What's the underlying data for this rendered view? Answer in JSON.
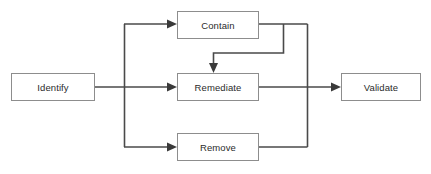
{
  "diagram": {
    "background_color": "#ffffff",
    "box_fill_color": "#ffffff",
    "box_border_color": "#8d8d8d",
    "line_color": "#4a4a4a",
    "text_color": "#2b2b2b",
    "nodes": [
      {
        "id": "identify",
        "label": "Identify",
        "x": 11,
        "y": 73,
        "w": 83,
        "h": 28
      },
      {
        "id": "contain",
        "label": "Contain",
        "x": 177,
        "y": 11,
        "w": 81,
        "h": 28
      },
      {
        "id": "remediate",
        "label": "Remediate",
        "x": 177,
        "y": 73,
        "w": 81,
        "h": 28
      },
      {
        "id": "remove",
        "label": "Remove",
        "x": 177,
        "y": 133,
        "w": 81,
        "h": 28
      },
      {
        "id": "validate",
        "label": "Validate",
        "x": 341,
        "y": 73,
        "w": 79,
        "h": 28
      }
    ],
    "edges": [
      {
        "id": "identify-to-fanout",
        "from": "identify",
        "to": "fanout-rail",
        "arrow": false
      },
      {
        "id": "fanout-to-contain",
        "from": "identify",
        "to": "contain",
        "arrow": true
      },
      {
        "id": "fanout-to-remediate",
        "from": "identify",
        "to": "remediate",
        "arrow": true
      },
      {
        "id": "fanout-to-remove",
        "from": "identify",
        "to": "remove",
        "arrow": true
      },
      {
        "id": "contain-to-remediate",
        "from": "contain",
        "to": "remediate",
        "arrow": true
      },
      {
        "id": "contain-to-rail",
        "from": "contain",
        "to": "join-rail",
        "arrow": false
      },
      {
        "id": "remove-to-rail",
        "from": "remove",
        "to": "join-rail",
        "arrow": false
      },
      {
        "id": "remediate-to-validate",
        "from": "remediate",
        "to": "validate",
        "arrow": true
      }
    ]
  }
}
